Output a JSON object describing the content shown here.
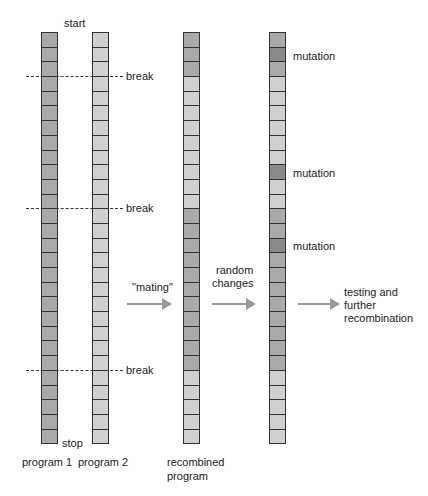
{
  "labels": {
    "start": "start",
    "stop": "stop",
    "break": "break",
    "mutation": "mutation",
    "program1": "program 1",
    "program2": "program 2",
    "recombined_line1": "recombined",
    "recombined_line2": "program",
    "mating": "\"mating\"",
    "random_line1": "random",
    "random_line2": "changes",
    "testing_line1": "testing and",
    "testing_line2": "further",
    "testing_line3": "recombination"
  },
  "colors": {
    "dark": "#a9a9a9",
    "light": "#d0d0d0",
    "mutation": "#8a8a8a"
  },
  "cell_count": 28,
  "break_lines": [
    3,
    12,
    23
  ],
  "columns": [
    {
      "name": "program-1",
      "x": 41,
      "pattern": "DDDDDDDDDDDDDDDDDDDDDDDDDDDD"
    },
    {
      "name": "program-2",
      "x": 92,
      "pattern": "LLLLLLLLLLLLLLLLLLLLLLLLLLLL"
    },
    {
      "name": "recombined-program",
      "x": 183,
      "pattern": "DDDLLLLLLLLLDDDDDDDDDDDLLLLL"
    },
    {
      "name": "mutated-program",
      "x": 269,
      "pattern": "DMDLLLLLLMLLDDMDDDDDDDDLLLLL"
    }
  ]
}
